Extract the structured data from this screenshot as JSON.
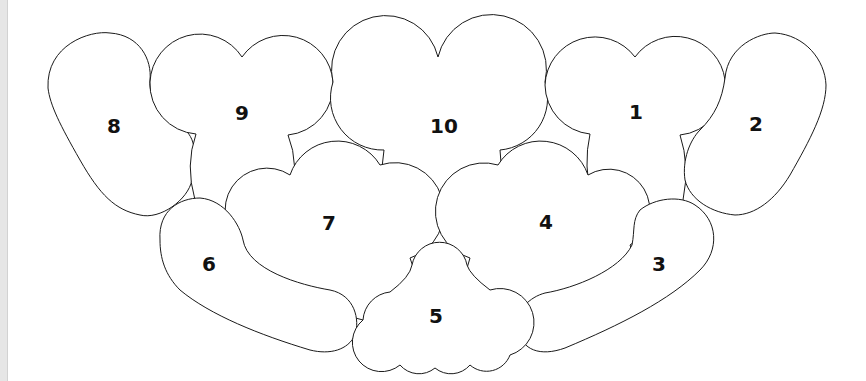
{
  "diagram": {
    "title": "",
    "stroke_color": "#1a1a1a",
    "fill_color": "#ffffff",
    "pieces": [
      {
        "id": "8",
        "label": "8",
        "label_x": 114,
        "label_y": 126,
        "path": "M 48 88 C 46 45 90 30 110 33 C 140 35 152 60 150 80 C 148 100 165 120 185 130 C 197 140 196 160 192 180 C 188 200 160 220 140 215 C 115 210 100 195 80 160 C 60 125 50 105 48 88 Z"
      },
      {
        "id": "9",
        "label": "9",
        "label_x": 242,
        "label_y": 113,
        "path": "M 150 82 A 50 50 0 0 1 242 57 A 50 50 0 0 1 333 82 A 50 50 0 0 1 288 135 Q 300 165 290 200 A 50 50 0 0 1 195 200 Q 185 165 196 134 A 50 50 0 0 1 150 82 Z"
      },
      {
        "id": "10",
        "label": "10",
        "label_x": 444,
        "label_y": 126,
        "path": "M 333 82 A 52 52 0 0 1 438 57 A 52 52 0 0 1 545 82 A 52 52 0 0 1 500 150 Q 505 195 485 215 A 55 55 0 0 1 385 215 Q 378 190 384 150 A 52 52 0 0 1 333 82 Z"
      },
      {
        "id": "1",
        "label": "1",
        "label_x": 636,
        "label_y": 112,
        "path": "M 545 85 A 50 50 0 0 1 635 57 A 50 50 0 0 1 725 80 A 50 50 0 0 1 680 135 Q 690 165 683 200 A 50 50 0 0 1 592 200 Q 583 165 590 134 A 50 50 0 0 1 545 85 Z"
      },
      {
        "id": "2",
        "label": "2",
        "label_x": 756,
        "label_y": 124,
        "path": "M 725 78 C 728 45 760 33 775 33 C 805 35 825 60 826 85 C 826 110 810 140 790 175 C 775 200 755 215 735 215 C 712 213 690 200 685 180 C 682 160 690 140 700 130 C 715 115 722 100 725 78 Z"
      },
      {
        "id": "7",
        "label": "7",
        "label_x": 329,
        "label_y": 223,
        "path": "M 290 175 A 50 50 0 0 1 380 165 A 45 45 0 0 1 410 258 A 40 40 0 0 1 330 295 A 45 45 0 0 1 244 245 A 40 40 0 0 1 290 175 Z"
      },
      {
        "id": "4",
        "label": "4",
        "label_x": 546,
        "label_y": 222,
        "path": "M 498 165 A 50 50 0 0 1 588 175 A 40 40 0 0 1 630 245 A 45 45 0 0 1 554 292 A 40 40 0 0 1 470 258 A 45 45 0 0 1 498 165 Z"
      },
      {
        "id": "6",
        "label": "6",
        "label_x": 209,
        "label_y": 264,
        "path": "M 160 240 C 158 210 180 198 200 198 C 225 200 240 225 243 240 C 248 270 300 285 330 290 C 355 295 360 320 355 335 C 348 350 330 355 310 350 C 260 335 210 315 180 290 C 165 275 160 258 160 240 Z"
      },
      {
        "id": "3",
        "label": "3",
        "label_x": 659,
        "label_y": 264,
        "path": "M 640 210 C 655 198 680 195 695 205 C 718 220 720 250 700 270 C 670 300 620 325 565 348 C 540 357 522 350 518 330 C 515 310 530 297 545 293 C 575 288 620 270 632 245 C 635 230 632 220 640 210 Z"
      },
      {
        "id": "5",
        "label": "5",
        "label_x": 436,
        "label_y": 316,
        "path": "M 412 265 A 28 28 0 0 1 467 265 Q 470 275 490 290 A 30 30 0 0 1 510 355 A 25 25 0 0 1 470 365 A 25 25 0 0 1 435 368 A 25 25 0 0 1 400 365 A 25 25 0 0 1 363 320 A 30 30 0 0 1 390 292 Q 410 277 412 265 Z"
      }
    ]
  }
}
